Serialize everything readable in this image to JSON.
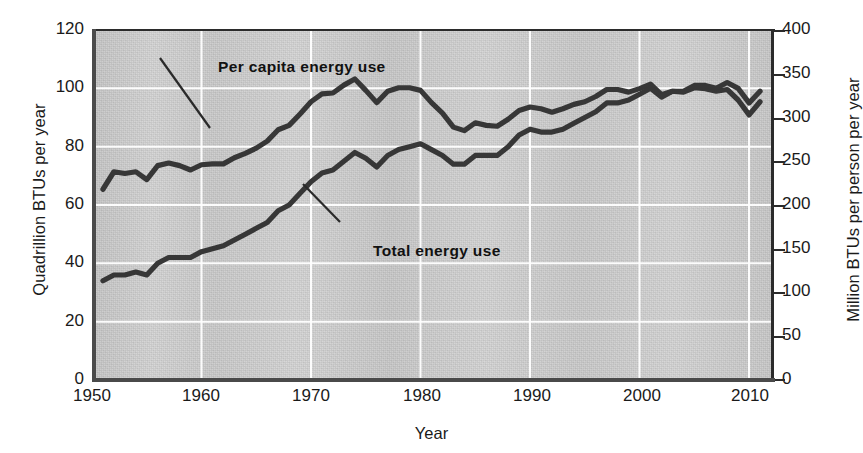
{
  "chart_data": {
    "type": "line",
    "title": "",
    "xlabel": "Year",
    "ylabel": "Quadrillion BTUs per year",
    "ylabel_right": "Million BTUs per person per year",
    "grid": true,
    "legend_position": "in-plot annotations",
    "xlim": [
      1949,
      2011
    ],
    "ylim": [
      0,
      120
    ],
    "ylim_right": [
      0,
      400
    ],
    "xticks": [
      "1950",
      "1960",
      "1970",
      "1980",
      "1990",
      "2000",
      "2010"
    ],
    "yticks_left": [
      "0",
      "20",
      "40",
      "60",
      "80",
      "100",
      "120"
    ],
    "yticks_right": [
      "0",
      "50",
      "100",
      "150",
      "200",
      "250",
      "300",
      "350",
      "400"
    ],
    "annotations": [
      {
        "text": "Per capita energy use",
        "series": "per_capita_energy_use"
      },
      {
        "text": "Total energy use",
        "series": "total_energy_use"
      }
    ],
    "series": [
      {
        "name": "Per capita energy use",
        "axis": "right",
        "units": "Million BTUs per person per year",
        "x": [
          1950,
          1951,
          1952,
          1953,
          1954,
          1955,
          1956,
          1957,
          1958,
          1959,
          1960,
          1961,
          1962,
          1963,
          1964,
          1965,
          1966,
          1967,
          1968,
          1969,
          1970,
          1971,
          1972,
          1973,
          1974,
          1975,
          1976,
          1977,
          1978,
          1979,
          1980,
          1981,
          1982,
          1983,
          1984,
          1985,
          1986,
          1987,
          1988,
          1989,
          1990,
          1991,
          1992,
          1993,
          1994,
          1995,
          1996,
          1997,
          1998,
          1999,
          2000,
          2001,
          2002,
          2003,
          2004,
          2005,
          2006,
          2007,
          2008,
          2009,
          2010
        ],
        "values_right": [
          218,
          238,
          236,
          238,
          229,
          245,
          248,
          245,
          240,
          246,
          247,
          247,
          254,
          259,
          265,
          273,
          286,
          291,
          304,
          318,
          327,
          328,
          337,
          344,
          331,
          317,
          330,
          334,
          334,
          331,
          317,
          305,
          289,
          285,
          294,
          291,
          290,
          298,
          308,
          312,
          310,
          306,
          310,
          315,
          318,
          324,
          332,
          332,
          329,
          333,
          338,
          326,
          330,
          329,
          334,
          333,
          330,
          332,
          320,
          303,
          318
        ],
        "values_left_equivalent": [
          65.4,
          71.4,
          70.8,
          71.4,
          68.7,
          73.5,
          74.4,
          73.5,
          72.0,
          73.8,
          74.1,
          74.1,
          76.2,
          77.7,
          79.5,
          81.9,
          85.8,
          87.3,
          91.2,
          95.4,
          98.1,
          98.4,
          101.1,
          103.2,
          99.3,
          95.1,
          99.0,
          100.2,
          100.2,
          99.3,
          95.1,
          91.5,
          86.7,
          85.5,
          88.2,
          87.3,
          87.0,
          89.4,
          92.4,
          93.6,
          93.0,
          91.8,
          93.0,
          94.5,
          95.4,
          97.2,
          99.6,
          99.6,
          98.7,
          99.9,
          101.4,
          97.8,
          99.0,
          98.7,
          100.2,
          99.9,
          99.0,
          99.6,
          96.0,
          90.9,
          95.4
        ]
      },
      {
        "name": "Total energy use",
        "axis": "left",
        "units": "Quadrillion BTUs per year",
        "x": [
          1950,
          1951,
          1952,
          1953,
          1954,
          1955,
          1956,
          1957,
          1958,
          1959,
          1960,
          1961,
          1962,
          1963,
          1964,
          1965,
          1966,
          1967,
          1968,
          1969,
          1970,
          1971,
          1972,
          1973,
          1974,
          1975,
          1976,
          1977,
          1978,
          1979,
          1980,
          1981,
          1982,
          1983,
          1984,
          1985,
          1986,
          1987,
          1988,
          1989,
          1990,
          1991,
          1992,
          1993,
          1994,
          1995,
          1996,
          1997,
          1998,
          1999,
          2000,
          2001,
          2002,
          2003,
          2004,
          2005,
          2006,
          2007,
          2008,
          2009,
          2010
        ],
        "values": [
          34,
          36,
          36,
          37,
          36,
          40,
          42,
          42,
          42,
          44,
          45,
          46,
          48,
          50,
          52,
          54,
          58,
          60,
          64,
          68,
          71,
          72,
          75,
          78,
          76,
          73,
          77,
          79,
          80,
          81,
          79,
          77,
          74,
          74,
          77,
          77,
          77,
          80,
          84,
          86,
          85,
          85,
          86,
          88,
          90,
          92,
          95,
          95,
          96,
          98,
          100,
          97,
          99,
          99,
          101,
          101,
          100,
          102,
          100,
          95,
          99
        ]
      }
    ]
  },
  "axes": {
    "left": {
      "title": "Quadrillion BTUs per year",
      "ticks": [
        "120",
        "100",
        "80",
        "60",
        "40",
        "20",
        "0"
      ]
    },
    "right": {
      "title": "Million BTUs per person per year",
      "ticks": [
        "400",
        "350",
        "300",
        "250",
        "200",
        "150",
        "100",
        "50",
        "0"
      ]
    },
    "bottom": {
      "title": "Year",
      "ticks": [
        "1950",
        "1960",
        "1970",
        "1980",
        "1990",
        "2000",
        "2010"
      ]
    }
  },
  "curve_labels": {
    "per_capita": "Per capita energy use",
    "total": "Total energy use"
  },
  "colors": {
    "plot_background": "#cdcdcd",
    "gridline": "#ffffff",
    "curve": "#333333",
    "axis": "#2b2b2b",
    "text": "#1a1a1a"
  }
}
